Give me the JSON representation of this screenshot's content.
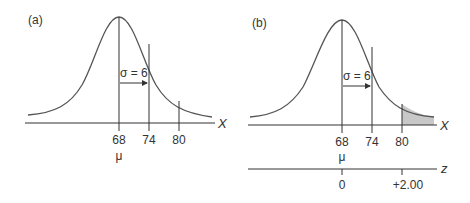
{
  "panels": [
    {
      "id": "a",
      "label": "(a)",
      "sigma_label": "σ = 6",
      "axis_label": "X",
      "ticks": [
        "68",
        "74",
        "80"
      ],
      "mean_symbol": "μ",
      "shaded_region": false
    },
    {
      "id": "b",
      "label": "(b)",
      "sigma_label": "σ = 6",
      "axis_label": "X",
      "ticks": [
        "68",
        "74",
        "80"
      ],
      "mean_symbol": "μ",
      "shaded_region": true,
      "shaded_from": "80",
      "z_axis": {
        "label": "z",
        "ticks": [
          "0",
          "+2.00"
        ]
      }
    }
  ],
  "colors": {
    "line": "#333333",
    "shade": "#c8c8c8"
  }
}
